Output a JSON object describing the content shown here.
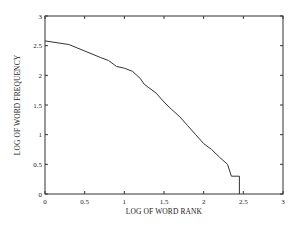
{
  "chart_data": {
    "type": "line",
    "title": "",
    "xlabel": "LOG OF WORD RANK",
    "ylabel": "LOG OF WORD FREQUENCY",
    "xlim": [
      0,
      3
    ],
    "ylim": [
      0,
      3
    ],
    "xticks": [
      0,
      0.5,
      1,
      1.5,
      2,
      2.5,
      3
    ],
    "xtick_labels": [
      "0",
      "0.5",
      "1",
      "1.5",
      "2",
      "2.5",
      "3"
    ],
    "yticks": [
      0,
      0.5,
      1,
      1.5,
      2,
      2.5,
      3
    ],
    "ytick_labels": [
      "0",
      "0.5",
      "1",
      "1.5",
      "2",
      "2.5",
      "3"
    ],
    "grid": false,
    "legend": null,
    "series": [
      {
        "name": "word frequency vs rank",
        "x": [
          0,
          0.3,
          0.5,
          0.7,
          0.8,
          0.9,
          1.0,
          1.1,
          1.2,
          1.25,
          1.3,
          1.4,
          1.5,
          1.6,
          1.7,
          1.8,
          1.9,
          2.0,
          2.1,
          2.2,
          2.3,
          2.35,
          2.45,
          2.45
        ],
        "y": [
          2.58,
          2.52,
          2.41,
          2.3,
          2.25,
          2.15,
          2.12,
          2.07,
          1.95,
          1.85,
          1.8,
          1.7,
          1.55,
          1.42,
          1.3,
          1.15,
          1.0,
          0.85,
          0.75,
          0.62,
          0.5,
          0.3,
          0.3,
          0
        ]
      }
    ]
  }
}
